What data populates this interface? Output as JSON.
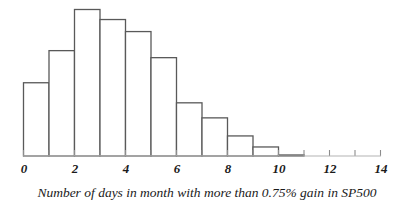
{
  "chart_data": {
    "type": "bar",
    "title": "",
    "subtitle": "",
    "xlabel": "Number of days in month with more than 0.75% gain in SP500",
    "ylabel": "",
    "categories": [
      "0-1",
      "1-2",
      "2-3",
      "3-4",
      "4-5",
      "5-6",
      "6-7",
      "7-8",
      "8-9",
      "9-10",
      "10-11",
      "11-12"
    ],
    "bin_edges": [
      0,
      1,
      2,
      3,
      4,
      5,
      6,
      7,
      8,
      9,
      10,
      11,
      12
    ],
    "values": [
      73,
      105,
      146,
      136,
      124,
      98,
      53,
      38,
      20,
      9,
      1,
      0
    ],
    "xlim": [
      0,
      14
    ],
    "ylim": [
      0,
      160
    ],
    "xticks": [
      0,
      1,
      2,
      3,
      4,
      5,
      6,
      7,
      8,
      9,
      10,
      11,
      12,
      13,
      14
    ],
    "xtick_labels": [
      "0",
      "",
      "2",
      "",
      "4",
      "",
      "6",
      "",
      "8",
      "",
      "10",
      "",
      "12",
      "",
      "14"
    ],
    "grid": false,
    "legend": false,
    "bar_fill_color": "#ffffff",
    "bar_edge_color": "#595959",
    "axis_color": "#b3b3b3",
    "text_color": "#1a1a1a"
  },
  "axis": {
    "labels": [
      {
        "value": "0",
        "x": 24
      },
      {
        "value": "2",
        "x": 75
      },
      {
        "value": "4",
        "x": 126
      },
      {
        "value": "6",
        "x": 177
      },
      {
        "value": "8",
        "x": 228
      },
      {
        "value": "10",
        "x": 279
      },
      {
        "value": "12",
        "x": 330
      },
      {
        "value": "14",
        "x": 381
      }
    ]
  },
  "caption": {
    "text": "Number of days in month with more than 0.75% gain in SP500"
  }
}
